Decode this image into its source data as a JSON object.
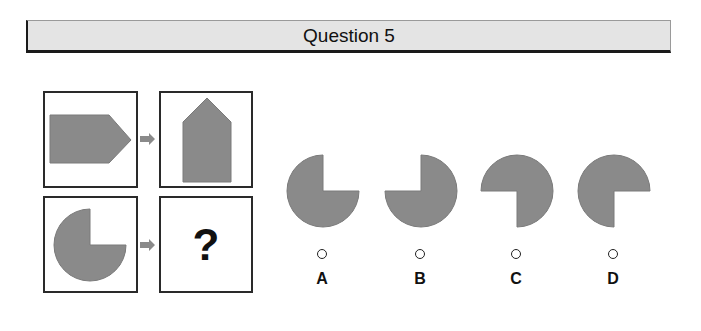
{
  "header": {
    "title": "Question 5"
  },
  "colors": {
    "shape_fill": "#8a8a8a",
    "shape_stroke": "#7a7a7a",
    "arrow_fill": "#8a8a8a",
    "header_bg": "#e4e4e4"
  },
  "puzzle": {
    "example_left": {
      "shape": "pentagon-pointing-right"
    },
    "example_right": {
      "shape": "pentagon-pointing-up"
    },
    "question_left": {
      "shape": "three-quarter-circle-gap-top-right"
    },
    "question_right": {
      "symbol": "?"
    },
    "arrow_icon": "arrow-right-icon"
  },
  "options": [
    {
      "letter": "A",
      "shape": "three-quarter-circle-gap-top-right"
    },
    {
      "letter": "B",
      "shape": "three-quarter-circle-gap-top-left"
    },
    {
      "letter": "C",
      "shape": "three-quarter-circle-gap-bottom-left"
    },
    {
      "letter": "D",
      "shape": "three-quarter-circle-gap-bottom-right"
    }
  ]
}
